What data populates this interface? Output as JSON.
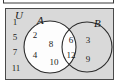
{
  "figure": {
    "type": "venn-diagram",
    "universe_label": "U",
    "set_a_label": "A",
    "set_b_label": "B",
    "colors": {
      "universe_fill": "#d9d9d9",
      "circle_fill": "#fdfdfd",
      "stroke": "#2b2b2b",
      "text": "#1c1c1c",
      "page_background": "#ffffff"
    },
    "regions": {
      "outside_only": {
        "name": "universe-only",
        "elements": [
          "1",
          "5",
          "7",
          "11"
        ]
      },
      "a_only": {
        "name": "a-only",
        "elements": [
          "2",
          "4",
          "8",
          "10"
        ]
      },
      "intersection": {
        "name": "a-intersect-b",
        "elements": [
          "6",
          "12"
        ]
      },
      "b_only": {
        "name": "b-only",
        "elements": [
          "3",
          "9"
        ]
      }
    }
  }
}
